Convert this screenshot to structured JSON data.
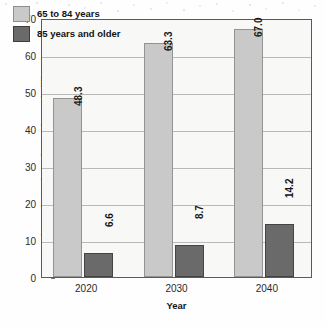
{
  "chart_data": {
    "type": "bar",
    "title": "",
    "xlabel": "Year",
    "ylabel": "Estimated Number of Americans (millions)",
    "categories": [
      "2020",
      "2030",
      "2040"
    ],
    "series": [
      {
        "name": "65 to 84 years",
        "color": "#c9c9c9",
        "values": [
          48.3,
          63.3,
          67.0
        ],
        "labels": [
          "48.3",
          "63.3",
          "67.0"
        ]
      },
      {
        "name": "85 years and older",
        "color": "#6a6a6a",
        "values": [
          6.6,
          8.7,
          14.2
        ],
        "labels": [
          "6.6",
          "8.7",
          "14.2"
        ]
      }
    ],
    "ylim": [
      0,
      70
    ],
    "yticks": [
      0,
      10,
      20,
      30,
      40,
      50,
      60,
      70
    ],
    "ytick_labels": [
      "0",
      "10",
      "20",
      "30",
      "40",
      "50",
      "60",
      "70"
    ],
    "grid": true,
    "legend_position": "top-left"
  },
  "legend": {
    "entries": [
      {
        "label": "65 to 84 years",
        "swatch": "light"
      },
      {
        "label": "85 years and older",
        "swatch": "dark"
      }
    ]
  }
}
